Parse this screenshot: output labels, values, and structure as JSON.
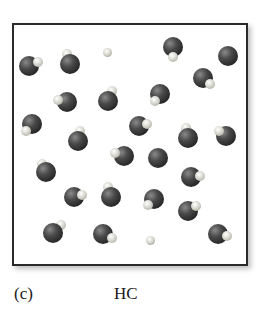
{
  "figure": {
    "panel_label": "(c)",
    "caption": "HC",
    "colors": {
      "chlorine": "#2a2a2a",
      "hydrogen": "#e0e0d8",
      "frame": "#2a2a2a"
    },
    "molecules": [
      {
        "cl": [
          29,
          66
        ],
        "h": [
          38,
          62
        ]
      },
      {
        "cl": [
          70,
          64
        ],
        "h": [
          67,
          54
        ]
      },
      {
        "cl": [
          173,
          47
        ],
        "h": [
          173,
          57
        ]
      },
      {
        "cl": [
          228,
          56
        ],
        "h": null
      },
      {
        "cl": [
          67,
          102
        ],
        "h": [
          58,
          100
        ]
      },
      {
        "cl": [
          108,
          101
        ],
        "h": [
          112,
          91
        ]
      },
      {
        "cl": [
          203,
          78
        ],
        "h": [
          210,
          84
        ]
      },
      {
        "cl": [
          160,
          94
        ],
        "h": [
          155,
          101
        ]
      },
      {
        "cl": [
          32,
          124
        ],
        "h": [
          26,
          131
        ]
      },
      {
        "cl": [
          78,
          141
        ],
        "h": [
          80,
          131
        ]
      },
      {
        "cl": [
          139,
          126
        ],
        "h": [
          147,
          124
        ]
      },
      {
        "cl": [
          188,
          138
        ],
        "h": [
          186,
          128
        ]
      },
      {
        "cl": [
          226,
          136
        ],
        "h": [
          219,
          131
        ]
      },
      {
        "cl": [
          46,
          172
        ],
        "h": [
          42,
          164
        ]
      },
      {
        "cl": [
          124,
          156
        ],
        "h": [
          115,
          153
        ]
      },
      {
        "cl": [
          158,
          158
        ],
        "h": null
      },
      {
        "cl": [
          191,
          177
        ],
        "h": [
          200,
          176
        ]
      },
      {
        "cl": [
          74,
          197
        ],
        "h": [
          82,
          195
        ]
      },
      {
        "cl": [
          111,
          197
        ],
        "h": [
          108,
          187
        ]
      },
      {
        "cl": [
          154,
          199
        ],
        "h": [
          148,
          205
        ]
      },
      {
        "cl": [
          188,
          211
        ],
        "h": [
          196,
          206
        ]
      },
      {
        "cl": [
          53,
          233
        ],
        "h": [
          61,
          225
        ]
      },
      {
        "cl": [
          103,
          234
        ],
        "h": [
          112,
          238
        ]
      },
      {
        "cl": [
          218,
          234
        ],
        "h": [
          227,
          236
        ]
      }
    ],
    "free_atoms": [
      [
        107,
        52
      ],
      [
        150,
        240
      ]
    ]
  }
}
